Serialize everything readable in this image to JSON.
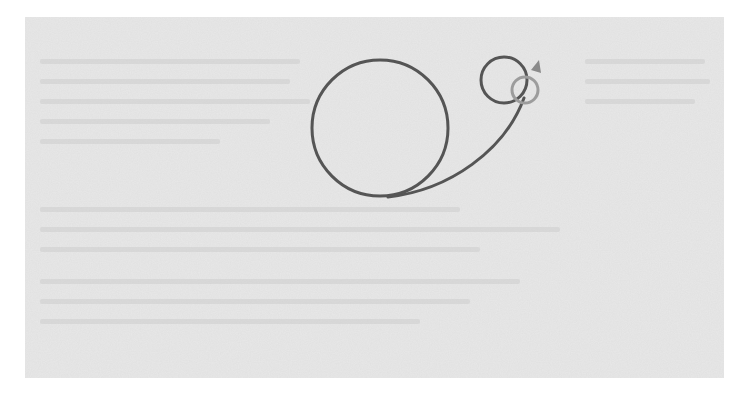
{
  "figure": {
    "background_color": "#e8e8e8",
    "stroke_color": "#555555",
    "light_stroke_color": "#9c9c9c",
    "arrow_color": "#8a8a8a",
    "shapes": {
      "large_circle": {
        "cx": 380,
        "cy": 128,
        "r": 68
      },
      "small_circle": {
        "cx": 504,
        "cy": 80,
        "r": 23
      },
      "light_ring": {
        "cx": 525,
        "cy": 90,
        "r": 13
      },
      "connector_curve": "M 388 197 C 450 190, 505 150, 524 98",
      "arrowhead": "M 531 70 L 539 60 L 541 73 Z"
    },
    "ghost_text_lines": [
      {
        "x": 15,
        "y": 42,
        "w": 260
      },
      {
        "x": 15,
        "y": 62,
        "w": 250
      },
      {
        "x": 15,
        "y": 82,
        "w": 270
      },
      {
        "x": 15,
        "y": 102,
        "w": 230
      },
      {
        "x": 15,
        "y": 122,
        "w": 180
      },
      {
        "x": 560,
        "y": 42,
        "w": 120
      },
      {
        "x": 560,
        "y": 62,
        "w": 125
      },
      {
        "x": 560,
        "y": 82,
        "w": 110
      },
      {
        "x": 15,
        "y": 190,
        "w": 420
      },
      {
        "x": 15,
        "y": 210,
        "w": 520
      },
      {
        "x": 15,
        "y": 230,
        "w": 440
      },
      {
        "x": 15,
        "y": 262,
        "w": 480
      },
      {
        "x": 15,
        "y": 282,
        "w": 430
      },
      {
        "x": 15,
        "y": 302,
        "w": 380
      }
    ]
  }
}
